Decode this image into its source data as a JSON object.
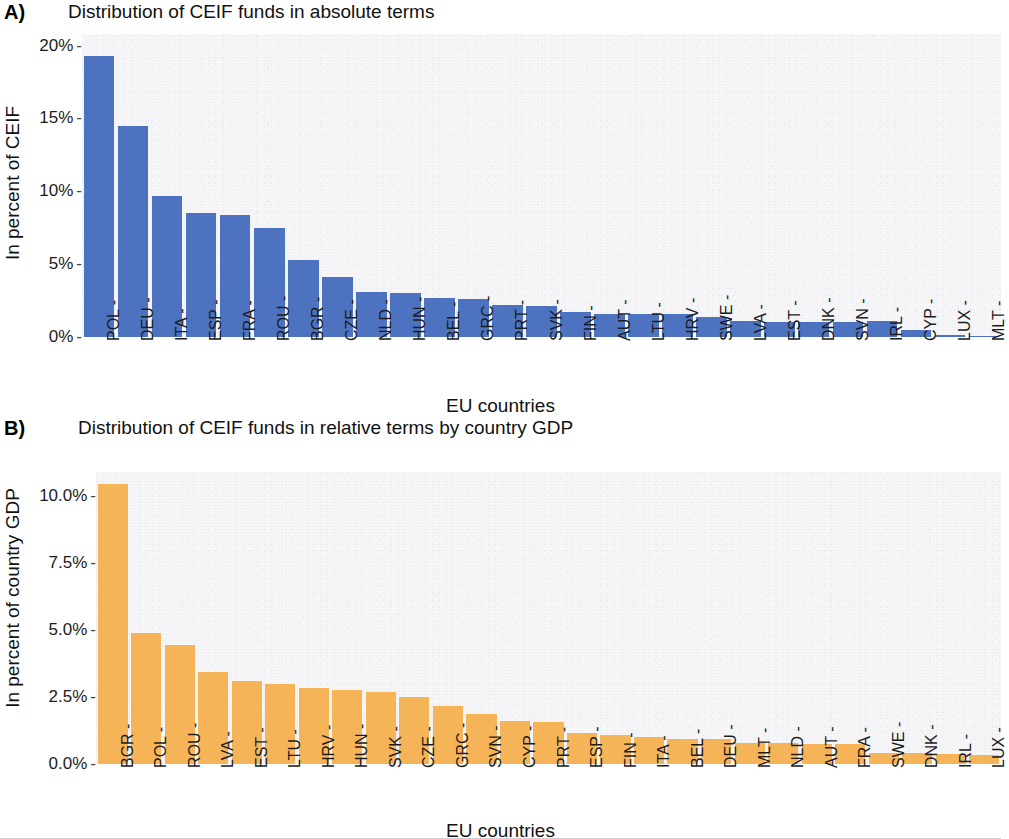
{
  "figure": {
    "xlabel": "EU countries",
    "bar_color_a": "#4C72C0",
    "bar_color_b": "#F6B459",
    "panel_bg": "#F7F7FA"
  },
  "panels": [
    {
      "tag": "A)",
      "title": "Distribution of CEIF funds in absolute terms",
      "ylabel": "In percent of CEIF",
      "xlabel": "EU countries",
      "yticks": [
        "0%",
        "5%",
        "10%",
        "15%",
        "20%"
      ]
    },
    {
      "tag": "B)",
      "title": "Distribution of CEIF funds in relative terms by country GDP",
      "ylabel": "In percent of country GDP",
      "xlabel": "EU countries",
      "yticks": [
        "0.0%",
        "2.5%",
        "5.0%",
        "7.5%",
        "10.0%"
      ]
    }
  ],
  "chart_data": [
    {
      "type": "bar",
      "panel": "A",
      "title": "Distribution of CEIF funds in absolute terms",
      "xlabel": "EU countries",
      "ylabel": "In percent of CEIF",
      "ylim": [
        0,
        20.8
      ],
      "ytick_values": [
        0,
        5,
        10,
        15,
        20
      ],
      "ytick_labels": [
        "0%",
        "5%",
        "10%",
        "15%",
        "20%"
      ],
      "grid": false,
      "legend": "none",
      "color": "#4C72C0",
      "categories": [
        "POL",
        "DEU",
        "ITA",
        "ESP",
        "FRA",
        "ROU",
        "BGR",
        "CZE",
        "NLD",
        "HUN",
        "BEL",
        "GRC",
        "PRT",
        "SVK",
        "FIN",
        "AUT",
        "LTU",
        "HRV",
        "SWE",
        "LVA",
        "EST",
        "DNK",
        "SVN",
        "IRL",
        "CYP",
        "LUX",
        "MLT"
      ],
      "values": [
        19.3,
        14.5,
        9.7,
        8.5,
        8.4,
        7.5,
        5.3,
        4.1,
        3.1,
        3.0,
        2.7,
        2.6,
        2.2,
        2.1,
        1.7,
        1.6,
        1.6,
        1.6,
        1.4,
        1.1,
        1.0,
        1.0,
        1.0,
        1.1,
        0.5,
        0.15,
        0.1
      ]
    },
    {
      "type": "bar",
      "panel": "B",
      "title": "Distribution of CEIF funds in relative terms by country GDP",
      "xlabel": "EU countries",
      "ylabel": "In percent of country GDP",
      "ylim": [
        0,
        10.9
      ],
      "ytick_values": [
        0,
        2.5,
        5.0,
        7.5,
        10.0
      ],
      "ytick_labels": [
        "0.0%",
        "2.5%",
        "5.0%",
        "7.5%",
        "10.0%"
      ],
      "grid": false,
      "legend": "none",
      "color": "#F6B459",
      "categories": [
        "BGR",
        "POL",
        "ROU",
        "LVA",
        "EST",
        "LTU",
        "HRV",
        "HUN",
        "SVK",
        "CZE",
        "GRC",
        "SVN",
        "CYP",
        "PRT",
        "ESP",
        "FIN",
        "ITA",
        "BEL",
        "DEU",
        "MLT",
        "NLD",
        "AUT",
        "FRA",
        "SWE",
        "DNK",
        "IRL",
        "LUX"
      ],
      "values": [
        10.45,
        4.9,
        4.45,
        3.45,
        3.1,
        3.0,
        2.85,
        2.75,
        2.7,
        2.5,
        2.15,
        1.85,
        1.6,
        1.55,
        1.15,
        1.1,
        1.0,
        0.95,
        0.92,
        0.8,
        0.78,
        0.75,
        0.75,
        0.42,
        0.4,
        0.38,
        0.35
      ]
    }
  ]
}
